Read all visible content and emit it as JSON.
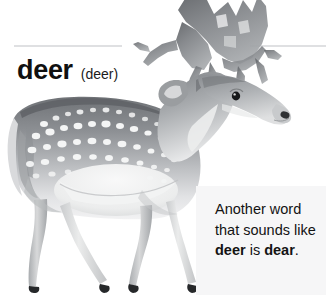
{
  "entry": {
    "headword": "deer",
    "pronunciation": "(deer)",
    "headword_color": "#101010"
  },
  "divider": {
    "color": "#dfe0e2"
  },
  "illustration": {
    "subject": "deer-illustration",
    "description": "fallow deer with palmate antlers and white spots",
    "alt": "deer"
  },
  "note": {
    "background": "#f6f6f7",
    "line1": "Another word",
    "line2": "that sounds",
    "line3_prefix": "like ",
    "line3_bold": "deer",
    "line3_suffix": " is",
    "line4_bold": "dear",
    "line4_suffix": ".",
    "full_text": "Another word that sounds like deer is dear."
  },
  "page": {
    "background": "#ffffff",
    "width": 326,
    "height": 295
  }
}
